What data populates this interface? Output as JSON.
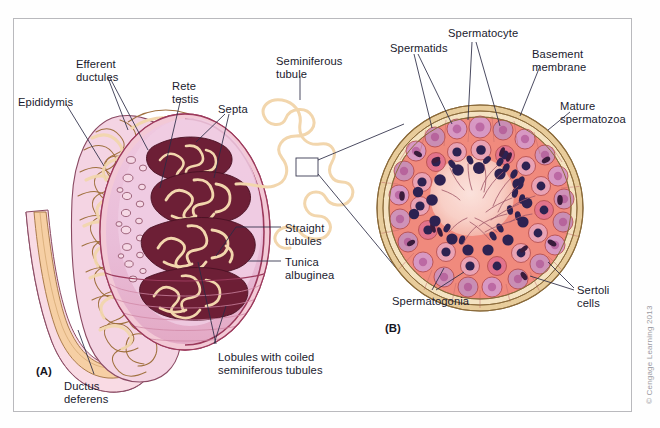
{
  "figure": {
    "title_hidden": "",
    "panel_a_id": "(A)",
    "panel_b_id": "(B)",
    "copyright": "© Cengage Learning 2013",
    "background": "#ffffff",
    "frame_color": "#b9b9bd"
  },
  "palette": {
    "leader_line": "#2b2b45",
    "text": "#1a1a2e",
    "tubule_tan": "#f2d6ad",
    "tubule_outline": "#7a5a33",
    "testis_pink": "#e8bcd6",
    "testis_pale_pink": "#f6d9e6",
    "tunica_band": "#f3c9d6",
    "tunica_outline": "#9c3a5c",
    "lobule_maroon": "#6d1f36",
    "lower_testis": "#e4a0b8",
    "duct_pink": "#f7d3de",
    "duct_cream": "#f6cfa4",
    "cell_salmon": "#f08a7e",
    "cell_mauve": "#c98fb4",
    "cell_rose": "#e2738c",
    "nucleus_navy": "#2e2352",
    "nucleus_dark": "#3b1c3c",
    "basement_cream": "#e8cd9c",
    "lumen_blush": "#fad6cf"
  },
  "panel_a": {
    "name": "testis-epididymis-overview",
    "labels": [
      {
        "id": "epididymis",
        "text": "Epididymis",
        "x": 18,
        "y": 96,
        "align": "left"
      },
      {
        "id": "efferent-ductules",
        "text": "Efferent\nductules",
        "x": 76,
        "y": 58,
        "align": "left"
      },
      {
        "id": "rete-testis",
        "text": "Rete\ntestis",
        "x": 172,
        "y": 80,
        "align": "left"
      },
      {
        "id": "septa",
        "text": "Septa",
        "x": 218,
        "y": 103,
        "align": "left"
      },
      {
        "id": "seminiferous-tubule",
        "text": "Seminiferous\ntubule",
        "x": 276,
        "y": 55,
        "align": "left"
      },
      {
        "id": "straight-tubules",
        "text": "Straight\ntubules",
        "x": 285,
        "y": 222,
        "align": "left"
      },
      {
        "id": "tunica-albuginea",
        "text": "Tunica\nalbuginea",
        "x": 285,
        "y": 256,
        "align": "left"
      },
      {
        "id": "lobules",
        "text": "Lobules with coiled\nseminiferous tubules",
        "x": 218,
        "y": 351,
        "align": "left"
      },
      {
        "id": "ductus-deferens",
        "text": "Ductus\ndeferens",
        "x": 64,
        "y": 380,
        "align": "left"
      }
    ]
  },
  "panel_b": {
    "name": "seminiferous-tubule-cross-section",
    "labels": [
      {
        "id": "spermatids",
        "text": "Spermatids",
        "x": 390,
        "y": 42,
        "align": "left"
      },
      {
        "id": "spermatocyte",
        "text": "Spermatocyte",
        "x": 448,
        "y": 27,
        "align": "left"
      },
      {
        "id": "basement-membrane",
        "text": "Basement\nmembrane",
        "x": 532,
        "y": 48,
        "align": "left"
      },
      {
        "id": "mature-spermatozoa",
        "text": "Mature\nspermatozoa",
        "x": 560,
        "y": 100,
        "align": "left"
      },
      {
        "id": "sertoli-cells",
        "text": "Sertoli\ncells",
        "x": 577,
        "y": 284,
        "align": "left"
      },
      {
        "id": "spermatogonia",
        "text": "Spermatogonia",
        "x": 392,
        "y": 295,
        "align": "left"
      }
    ]
  }
}
